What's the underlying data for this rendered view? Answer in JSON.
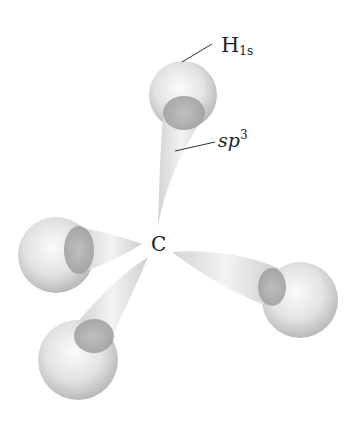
{
  "diagram": {
    "center_atom": {
      "label": "C",
      "x": 158,
      "y": 245
    },
    "labels": {
      "h_main": "H",
      "h_sub": "1s",
      "sp_main": "sp",
      "sp_sup": "3"
    },
    "orbitals": [
      {
        "name": "top",
        "lobe_tip": [
          158,
          225
        ],
        "sphere": {
          "cx": 183,
          "cy": 95,
          "r": 34
        }
      },
      {
        "name": "left",
        "lobe_tip": [
          142,
          244
        ],
        "sphere": {
          "cx": 56,
          "cy": 255,
          "r": 38
        }
      },
      {
        "name": "bottom-left",
        "lobe_tip": [
          148,
          258
        ],
        "sphere": {
          "cx": 78,
          "cy": 360,
          "r": 40
        }
      },
      {
        "name": "right",
        "lobe_tip": [
          172,
          252
        ],
        "sphere": {
          "cx": 300,
          "cy": 300,
          "r": 38
        }
      }
    ],
    "colors": {
      "sphere": "#d9d9d9",
      "overlap": "#a8a8a8",
      "lobe": "#e6e6e6",
      "text": "#222222"
    }
  }
}
